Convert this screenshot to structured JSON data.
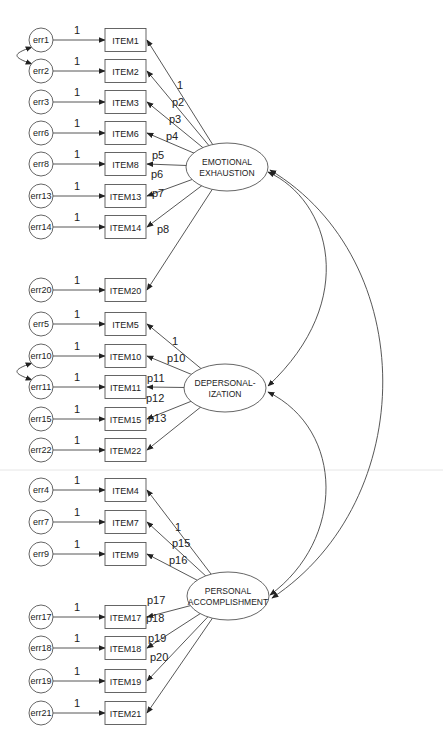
{
  "diagram": {
    "colors": {
      "stroke": "#444444",
      "text": "#222222",
      "background": "#ffffff",
      "separator": "#e6e6e6"
    },
    "factors": [
      {
        "id": "EE",
        "label_lines": [
          "EMOTIONAL",
          "EXHAUSTION"
        ],
        "cx": 227,
        "cy": 167,
        "rx": 41,
        "ry": 24
      },
      {
        "id": "DP",
        "label_lines": [
          "DEPERSONAL-",
          "IZATION"
        ],
        "cx": 225,
        "cy": 388,
        "rx": 41,
        "ry": 24
      },
      {
        "id": "PA",
        "label_lines": [
          "PERSONAL",
          "ACCOMPLISHMENT"
        ],
        "cx": 228,
        "cy": 596,
        "rx": 41,
        "ry": 24
      }
    ],
    "items": [
      {
        "id": "ITEM1",
        "label": "ITEM1",
        "error": "err1",
        "factor": "EE",
        "cy": 40,
        "loading": "1",
        "err_weight": "1",
        "lx": 177,
        "ly": 89
      },
      {
        "id": "ITEM2",
        "label": "ITEM2",
        "error": "err2",
        "factor": "EE",
        "cy": 71,
        "loading": "p2",
        "err_weight": "1",
        "lx": 172,
        "ly": 106
      },
      {
        "id": "ITEM3",
        "label": "ITEM3",
        "error": "err3",
        "factor": "EE",
        "cy": 102,
        "loading": "p3",
        "err_weight": "1",
        "lx": 169,
        "ly": 123
      },
      {
        "id": "ITEM6",
        "label": "ITEM6",
        "error": "err6",
        "factor": "EE",
        "cy": 133,
        "loading": "p4",
        "err_weight": "1",
        "lx": 166,
        "ly": 140
      },
      {
        "id": "ITEM8",
        "label": "ITEM8",
        "error": "err8",
        "factor": "EE",
        "cy": 164,
        "loading": "p5",
        "err_weight": "1",
        "lx": 152,
        "ly": 159
      },
      {
        "id": "ITEM13",
        "label": "ITEM13",
        "error": "err13",
        "factor": "EE",
        "cy": 196,
        "loading": "p6",
        "err_weight": "1",
        "lx": 151,
        "ly": 178
      },
      {
        "id": "ITEM14",
        "label": "ITEM14",
        "error": "err14",
        "factor": "EE",
        "cy": 227,
        "loading": "p7",
        "err_weight": "1",
        "lx": 152,
        "ly": 197
      },
      {
        "id": "ITEM20",
        "label": "ITEM20",
        "error": "err20",
        "factor": "EE",
        "cy": 290,
        "loading": "p8",
        "err_weight": "1",
        "lx": 157,
        "ly": 233
      },
      {
        "id": "ITEM5",
        "label": "ITEM5",
        "error": "err5",
        "factor": "DP",
        "cy": 324,
        "loading": "1",
        "err_weight": "1",
        "lx": 172,
        "ly": 345
      },
      {
        "id": "ITEM10",
        "label": "ITEM10",
        "error": "err10",
        "factor": "DP",
        "cy": 356,
        "loading": "p10",
        "err_weight": "1",
        "lx": 167,
        "ly": 362
      },
      {
        "id": "ITEM11",
        "label": "ITEM11",
        "error": "err11",
        "factor": "DP",
        "cy": 387,
        "loading": "p11",
        "err_weight": "1",
        "lx": 147,
        "ly": 382
      },
      {
        "id": "ITEM15",
        "label": "ITEM15",
        "error": "err15",
        "factor": "DP",
        "cy": 419,
        "loading": "p12",
        "err_weight": "1",
        "lx": 146,
        "ly": 402
      },
      {
        "id": "ITEM22",
        "label": "ITEM22",
        "error": "err22",
        "factor": "DP",
        "cy": 450,
        "loading": "p13",
        "err_weight": "1",
        "lx": 148,
        "ly": 422
      },
      {
        "id": "ITEM4",
        "label": "ITEM4",
        "error": "err4",
        "factor": "PA",
        "cy": 490,
        "loading": "1",
        "err_weight": "1",
        "lx": 175,
        "ly": 531
      },
      {
        "id": "ITEM7",
        "label": "ITEM7",
        "error": "err7",
        "factor": "PA",
        "cy": 522,
        "loading": "p15",
        "err_weight": "1",
        "lx": 172,
        "ly": 547
      },
      {
        "id": "ITEM9",
        "label": "ITEM9",
        "error": "err9",
        "factor": "PA",
        "cy": 554,
        "loading": "p16",
        "err_weight": "1",
        "lx": 169,
        "ly": 564
      },
      {
        "id": "ITEM17",
        "label": "ITEM17",
        "error": "err17",
        "factor": "PA",
        "cy": 617,
        "loading": "p17",
        "err_weight": "1",
        "lx": 147,
        "ly": 604
      },
      {
        "id": "ITEM18",
        "label": "ITEM18",
        "error": "err18",
        "factor": "PA",
        "cy": 648,
        "loading": "p18",
        "err_weight": "1",
        "lx": 146,
        "ly": 622
      },
      {
        "id": "ITEM19",
        "label": "ITEM19",
        "error": "err19",
        "factor": "PA",
        "cy": 681,
        "loading": "p19",
        "err_weight": "1",
        "lx": 148,
        "ly": 642
      },
      {
        "id": "ITEM21",
        "label": "ITEM21",
        "error": "err21",
        "factor": "PA",
        "cy": 713,
        "loading": "p20",
        "err_weight": "1",
        "lx": 150,
        "ly": 661
      }
    ],
    "error_covariances": [
      {
        "from": "err1",
        "to": "err2"
      },
      {
        "from": "err10",
        "to": "err11"
      }
    ],
    "factor_covariances": [
      {
        "from": "EE",
        "to": "DP"
      },
      {
        "from": "DP",
        "to": "PA"
      },
      {
        "from": "EE",
        "to": "PA"
      }
    ]
  }
}
